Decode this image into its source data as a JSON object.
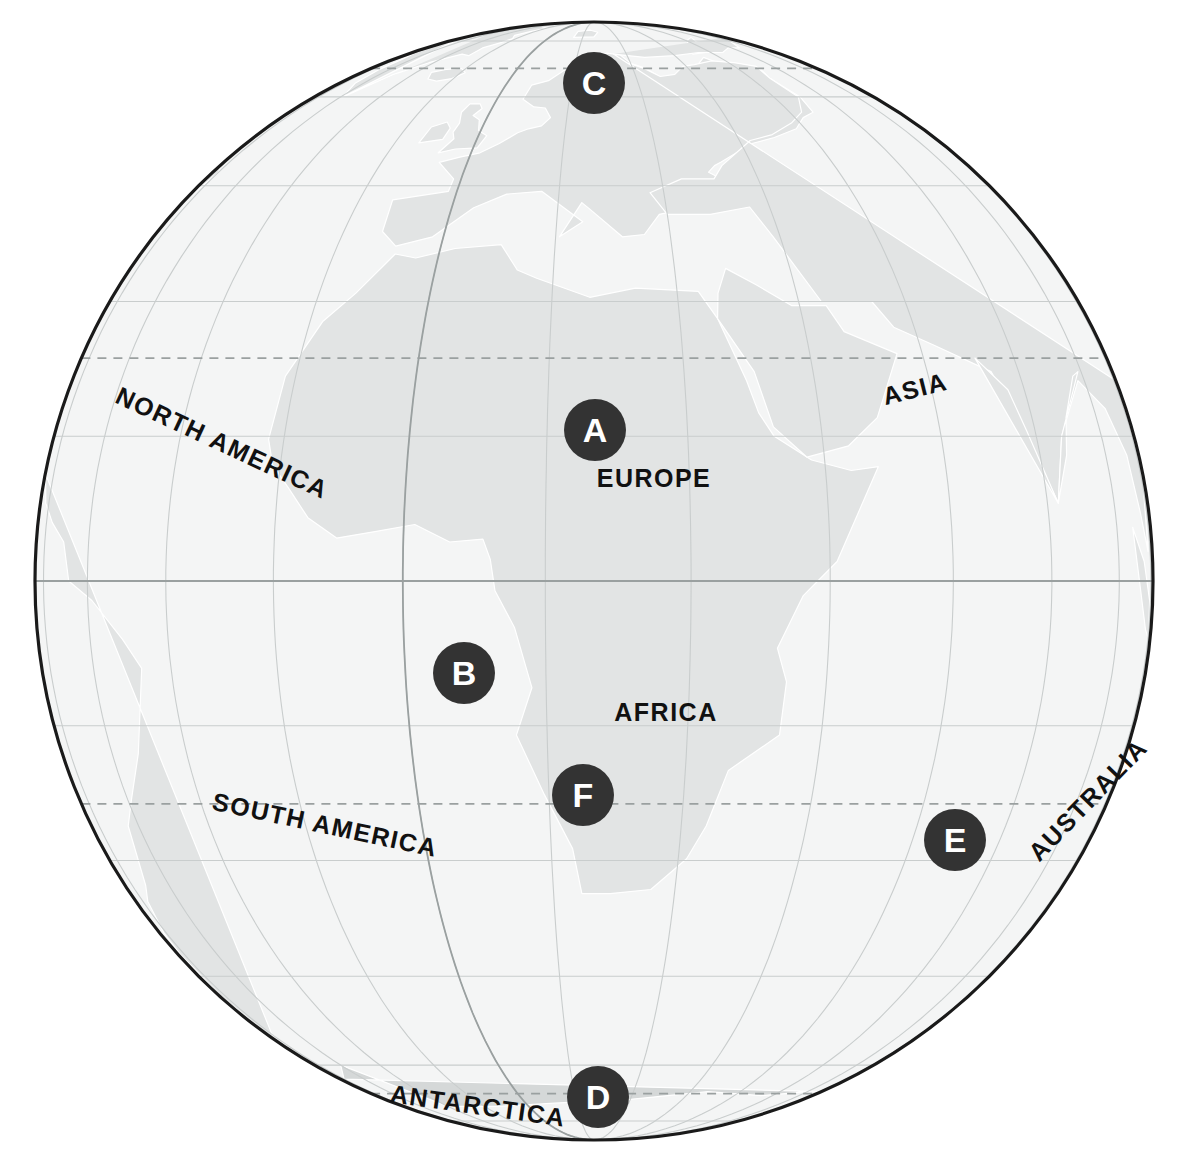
{
  "map": {
    "type": "orthographic-globe",
    "projection_center": {
      "lon": 20,
      "lat": 0
    },
    "globe": {
      "cx": 594,
      "cy": 581,
      "r": 559
    },
    "colors": {
      "ocean": "#f4f5f5",
      "land": "#e2e4e4",
      "land_alt": "#d9dcdc",
      "antarctica": "#d5d8d8",
      "graticule": "#c9cdcd",
      "meridian_prime": "#9aa0a0",
      "equator": "#9aa0a0",
      "tropic_dashed": "#9aa0a0",
      "outline": "#1a1a1a",
      "marker_fill": "#333333",
      "marker_text": "#ffffff",
      "label_text": "#111111"
    },
    "graticule_spacing_degrees": 15,
    "special_lines": [
      {
        "name": "equator",
        "latitude": 0,
        "style": "solid"
      },
      {
        "name": "prime-meridian",
        "longitude": 0,
        "style": "solid"
      },
      {
        "name": "tropic-of-cancer",
        "latitude": 23.5,
        "style": "dashed"
      },
      {
        "name": "tropic-of-capricorn",
        "latitude": -23.5,
        "style": "dashed"
      },
      {
        "name": "arctic-circle",
        "latitude": 66.5,
        "style": "dashed"
      },
      {
        "name": "antarctic-circle",
        "latitude": -66.5,
        "style": "dashed"
      }
    ]
  },
  "continent_labels": [
    {
      "id": "north-america",
      "text": "NORTH AMERICA",
      "x": 222,
      "y": 443,
      "rotation": 25,
      "font_size": 25
    },
    {
      "id": "asia",
      "text": "ASIA",
      "x": 915,
      "y": 389,
      "rotation": -14,
      "font_size": 25
    },
    {
      "id": "europe",
      "text": "EUROPE",
      "x": 654,
      "y": 478,
      "rotation": 0,
      "font_size": 25
    },
    {
      "id": "africa",
      "text": "AFRICA",
      "x": 666,
      "y": 712,
      "rotation": 0,
      "font_size": 25
    },
    {
      "id": "south-america",
      "text": "SOUTH AMERICA",
      "x": 325,
      "y": 825,
      "rotation": 12,
      "font_size": 25
    },
    {
      "id": "australia",
      "text": "AUSTRALIA",
      "x": 1088,
      "y": 800,
      "rotation": -46,
      "font_size": 25
    },
    {
      "id": "antarctica",
      "text": "ANTARCTICA",
      "x": 478,
      "y": 1106,
      "rotation": 8,
      "font_size": 25
    }
  ],
  "markers": [
    {
      "id": "marker-c",
      "letter": "C",
      "x": 594,
      "y": 83,
      "on": "north-pole-region"
    },
    {
      "id": "marker-a",
      "letter": "A",
      "x": 595,
      "y": 430,
      "on": "europe-prime-meridian"
    },
    {
      "id": "marker-b",
      "letter": "B",
      "x": 464,
      "y": 673,
      "on": "tropic-of-cancer"
    },
    {
      "id": "marker-f",
      "letter": "F",
      "x": 583,
      "y": 795,
      "on": "equator"
    },
    {
      "id": "marker-e",
      "letter": "E",
      "x": 955,
      "y": 840,
      "on": "tropic-of-capricorn"
    },
    {
      "id": "marker-d",
      "letter": "D",
      "x": 598,
      "y": 1097,
      "on": "antarctic-circle"
    }
  ]
}
